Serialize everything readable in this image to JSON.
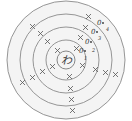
{
  "diagram": {
    "type": "concentric-shell-diagram",
    "center_label": "わ",
    "shells": [
      {
        "index": 1,
        "label": "1",
        "pair_marker": "0",
        "crosses": 3
      },
      {
        "index": 2,
        "label": "2",
        "pair_marker": "0",
        "crosses": 5
      },
      {
        "index": 3,
        "label": "3",
        "pair_marker": "0",
        "crosses": 5
      },
      {
        "index": 4,
        "label": "4",
        "pair_marker": "0",
        "crosses": 4
      }
    ],
    "colors": {
      "ring_stroke": "#8a8a8a",
      "ring_fill": "#f4f4f4",
      "mark": "#555555",
      "background": "#ffffff"
    }
  }
}
